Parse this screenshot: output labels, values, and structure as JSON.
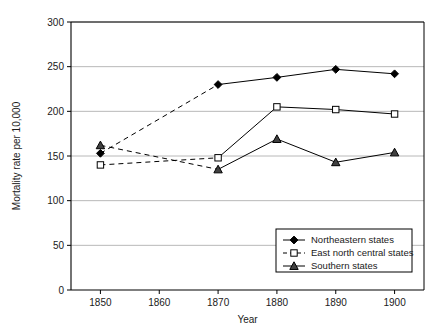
{
  "chart_data": {
    "type": "line",
    "title": "",
    "xlabel": "Year",
    "ylabel": "Mortality rate per 10,000",
    "x": [
      1850,
      1870,
      1880,
      1890,
      1900
    ],
    "xlim": [
      1845,
      1905
    ],
    "ylim": [
      0,
      300
    ],
    "xticks": [
      1850,
      1860,
      1870,
      1880,
      1890,
      1900
    ],
    "xticklabels": [
      "1850",
      "1860",
      "1870",
      "1880",
      "1890",
      "1900"
    ],
    "yticks": [
      0,
      50,
      100,
      150,
      200,
      250,
      300
    ],
    "yticklabels": [
      "0",
      "50",
      "100",
      "150",
      "200",
      "250",
      "300"
    ],
    "grid": "horizontal",
    "legend_position": "lower right",
    "series": [
      {
        "name": "Northeastern states",
        "marker": "filled-diamond",
        "values": [
          153,
          230,
          238,
          247,
          242
        ],
        "segment_styles": [
          "dashed",
          "solid",
          "solid",
          "solid"
        ]
      },
      {
        "name": "East north central states",
        "marker": "open-square",
        "values": [
          140,
          148,
          205,
          202,
          197
        ],
        "segment_styles": [
          "dashed",
          "solid",
          "solid",
          "solid"
        ]
      },
      {
        "name": "Southern states",
        "marker": "filled-triangle",
        "values": [
          162,
          135,
          169,
          143,
          154
        ],
        "segment_styles": [
          "dashed",
          "solid",
          "solid",
          "solid"
        ]
      }
    ]
  },
  "legend": {
    "entries": [
      {
        "label": "Northeastern states"
      },
      {
        "label": "East north central states"
      },
      {
        "label": "Southern states"
      }
    ]
  },
  "colors": {
    "line": "#000000",
    "grid": "#b0b0b0",
    "axis": "#000000",
    "background": "#ffffff"
  }
}
